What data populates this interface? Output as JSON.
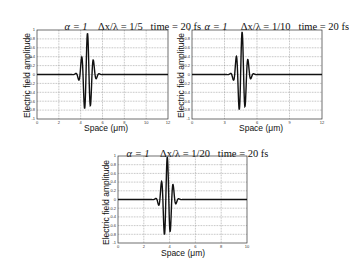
{
  "chart_data": [
    {
      "type": "line",
      "title": "α = 1   Δx/λ = 1/5   time = 20 fs",
      "title_parts": {
        "alpha": "α = 1",
        "ratio": "Δx/λ = 1/5",
        "time": "time = 20 fs"
      },
      "xlabel": "Space (μm)",
      "ylabel": "Electric field amplitude",
      "xlim": [
        0,
        12
      ],
      "ylim": [
        -1,
        1
      ],
      "xticks": [
        0,
        2,
        4,
        6,
        8,
        10,
        12
      ],
      "yticks": [
        1,
        0.8,
        0.6,
        0.4,
        0.2,
        0,
        -0.2,
        -0.4,
        -0.6,
        -0.8,
        -1
      ],
      "grid": true,
      "series": [
        {
          "name": "E-field",
          "center": 4.6,
          "carrier_period": 0.55,
          "envelope_width": 0.55,
          "peak": 0.93
        }
      ],
      "box": {
        "left": 37,
        "top": 30,
        "right": 168,
        "bottom": 119
      }
    },
    {
      "type": "line",
      "title": "α = 1   Δx/λ = 1/10   time = 20 fs",
      "title_parts": {
        "alpha": "α = 1",
        "ratio": "Δx/λ = 1/10",
        "time": "time = 20 fs"
      },
      "xlabel": "Space (μm)",
      "ylabel": "Electric field amplitude",
      "xlim": [
        0,
        12
      ],
      "ylim": [
        -1,
        1
      ],
      "xticks": [
        0,
        3,
        6,
        9,
        12
      ],
      "yticks": [
        1,
        0.8,
        0.6,
        0.4,
        0.2,
        0,
        -0.2,
        -0.4,
        -0.6,
        -0.8,
        -1
      ],
      "grid": true,
      "series": [
        {
          "name": "E-field",
          "center": 4.6,
          "carrier_period": 0.55,
          "envelope_width": 0.55,
          "peak": 0.96
        }
      ],
      "box": {
        "left": 192,
        "top": 30,
        "right": 322,
        "bottom": 119
      }
    },
    {
      "type": "line",
      "title": "α = 1   Δx/λ = 1/20   time = 20 fs",
      "title_parts": {
        "alpha": "α = 1",
        "ratio": "Δx/λ = 1/20",
        "time": "time = 20 fs"
      },
      "xlabel": "Space (μm)",
      "ylabel": "Electric field amplitude",
      "xlim": [
        0,
        10
      ],
      "ylim": [
        -1,
        1
      ],
      "xticks": [
        0,
        2,
        4,
        6,
        8,
        10
      ],
      "yticks": [
        1,
        0.8,
        0.6,
        0.4,
        0.2,
        0,
        -0.2,
        -0.4,
        -0.6,
        -0.8,
        -1
      ],
      "grid": true,
      "series": [
        {
          "name": "E-field",
          "center": 3.8,
          "carrier_period": 0.46,
          "envelope_width": 0.46,
          "peak": 0.98
        }
      ],
      "box": {
        "left": 118,
        "top": 156,
        "right": 247,
        "bottom": 243
      }
    }
  ],
  "colors": {
    "line": "#111111",
    "grid": "#777777",
    "axis": "#333333"
  }
}
